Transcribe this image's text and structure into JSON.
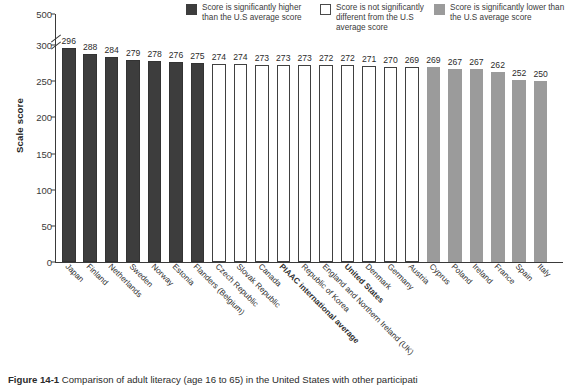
{
  "chart_data": {
    "type": "bar",
    "title": "",
    "xlabel": "",
    "ylabel": "Scale score",
    "ylim": [
      0,
      500
    ],
    "yticks": [
      0,
      50,
      100,
      150,
      200,
      250,
      300,
      500
    ],
    "ytick_labels": [
      "0",
      "50",
      "100",
      "150",
      "200",
      "250",
      "300",
      "500"
    ],
    "axis_break": "between 300 and 500",
    "grid": false,
    "legend_position": "top-right",
    "categories": [
      "Japan",
      "Finland",
      "Netherlands",
      "Sweden",
      "Norway",
      "Estonia",
      "Flanders (Belgium)",
      "Czech Republic",
      "Slovak Republic",
      "Canada",
      "PIAAC international average",
      "Republic of Korea",
      "England and Northern Ireland (UK)",
      "United States",
      "Denmark",
      "Germany",
      "Austria",
      "Cyprus",
      "Poland",
      "Ireland",
      "France",
      "Spain",
      "Italy"
    ],
    "values": [
      296,
      288,
      284,
      279,
      278,
      276,
      275,
      274,
      274,
      273,
      273,
      273,
      272,
      272,
      271,
      270,
      269,
      269,
      267,
      267,
      262,
      252,
      250
    ],
    "groups": [
      "higher",
      "higher",
      "higher",
      "higher",
      "higher",
      "higher",
      "higher",
      "same",
      "same",
      "same",
      "same",
      "same",
      "same",
      "same",
      "same",
      "same",
      "same",
      "lower",
      "lower",
      "lower",
      "lower",
      "lower",
      "lower"
    ],
    "bold_categories": [
      "PIAAC international average",
      "United States"
    ]
  },
  "legend": {
    "items": [
      {
        "swatch": "dark",
        "label": "Score is significantly higher than the U.S average score"
      },
      {
        "swatch": "white",
        "label": "Score is not significantly different from the U.S average score"
      },
      {
        "swatch": "gray",
        "label": "Score is significantly lower than the U.S average score"
      }
    ]
  },
  "colors": {
    "higher": "#3d3d3d",
    "same": "#ffffff",
    "same_border": "#404040",
    "lower": "#9b9b9b",
    "axis": "#3a3a3a"
  },
  "caption": {
    "number": "Figure 14-1",
    "text": "Comparison of adult literacy (age 16 to 65) in the United States with other participati"
  }
}
